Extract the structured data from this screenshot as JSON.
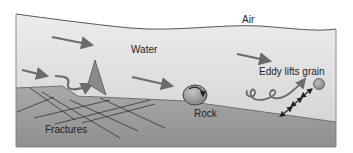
{
  "labels": {
    "air": "Air",
    "water": "Water",
    "rock": "Rock",
    "eddy": "Eddy lifts grain",
    "fractures": "Fractures"
  },
  "colors": {
    "background": "#ffffff",
    "water_top": "#ececec",
    "water_bottom": "#d6d6d6",
    "bed_top": "#a9a9a9",
    "bed_bottom": "#8f8f8f",
    "outline": "#555555",
    "arrow": "#6b6b6b",
    "fracture_line": "#333333",
    "rock_fill": "#9a9a9a",
    "grain_fill": "#9c9c9c"
  },
  "icons": {
    "flow_arrows": "flow-arrow-icon",
    "wedge": "plucked-fragment-icon",
    "rock": "rock-boulder-icon",
    "grain": "sediment-grain-icon",
    "eddy": "eddy-swirl-icon",
    "lift_arrows": "double-headed-lift-arrow-icon"
  }
}
